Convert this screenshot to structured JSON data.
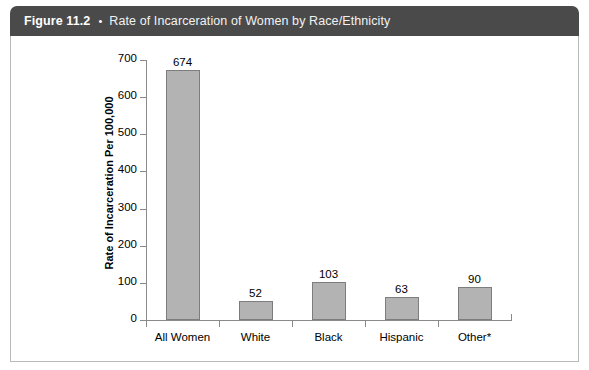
{
  "figure": {
    "number": "Figure 11.2",
    "bullet": "•",
    "title": "Rate of Incarceration of Women by Race/Ethnicity"
  },
  "chart_data": {
    "type": "bar",
    "title": "Rate of Incarceration of Women by Race/Ethnicity",
    "xlabel": "",
    "ylabel": "Rate of Incarceration Per 100,000",
    "categories": [
      "All Women",
      "White",
      "Black",
      "Hispanic",
      "Other*"
    ],
    "values": [
      674,
      52,
      103,
      63,
      90
    ],
    "value_labels": [
      "674",
      "52",
      "103",
      "63",
      "90"
    ],
    "ylim": [
      0,
      700
    ],
    "ytick_values": [
      0,
      100,
      200,
      300,
      400,
      500,
      600,
      700
    ],
    "ytick_labels": [
      "0",
      "100",
      "200",
      "300",
      "400",
      "500",
      "600",
      "700"
    ],
    "grid": false,
    "legend": false,
    "bar_color": "#b3b3b3",
    "bar_edge_color": "#7d7d7d",
    "axis_color": "#8a8a8a"
  },
  "colors": {
    "header_background": "#4a4a4a",
    "header_text": "#ffffff",
    "panel_background": "#ffffff",
    "panel_border": "#b9b9b9"
  }
}
